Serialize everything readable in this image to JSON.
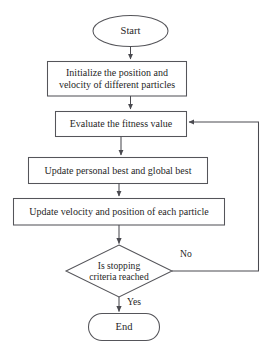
{
  "diagram": {
    "type": "flowchart",
    "background_color": "#ffffff",
    "stroke_color": "#55555a",
    "text_color": "#1f1f1f"
  },
  "nodes": {
    "start": {
      "label": "Start",
      "shape": "ellipse"
    },
    "initialize": {
      "label": "Initialize the position and\nvelocity of different particles",
      "shape": "rectangle"
    },
    "evaluate": {
      "label": "Evaluate the fitness value",
      "shape": "rectangle"
    },
    "update_best": {
      "label": "Update personal  best and global best",
      "shape": "rectangle"
    },
    "update_velocity": {
      "label": "Update velocity and position of each particle",
      "shape": "rectangle"
    },
    "decision": {
      "label": "Is stopping\ncriteria reached",
      "shape": "diamond"
    },
    "end": {
      "label": "End",
      "shape": "stadium"
    }
  },
  "edge_labels": {
    "no": "No",
    "yes": "Yes"
  }
}
